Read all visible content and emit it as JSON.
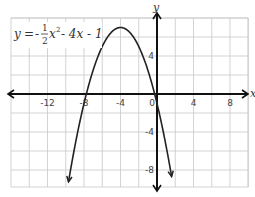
{
  "chart_data": {
    "type": "line",
    "title": "",
    "equation": {
      "lhs": "y",
      "eq": "=",
      "sign": "-",
      "frac_num": "1",
      "frac_den": "2",
      "rest_var": "x",
      "rest_exp": "2",
      "rest_tail": "- 4x - 1",
      "full": "y = -1/2 x^2 - 4x - 1"
    },
    "xlabel": "x",
    "ylabel": "y",
    "xlim": [
      -16,
      10
    ],
    "ylim": [
      -10,
      8
    ],
    "grid": true,
    "grid_step": 2,
    "x_ticks": [
      {
        "value": -12,
        "label": "-12"
      },
      {
        "value": -8,
        "label": "-8"
      },
      {
        "value": -4,
        "label": "-4"
      },
      {
        "value": 0,
        "label": "0"
      },
      {
        "value": 4,
        "label": "4"
      },
      {
        "value": 8,
        "label": "8"
      }
    ],
    "y_ticks": [
      {
        "value": 4,
        "label": "4"
      },
      {
        "value": -4,
        "label": "-4"
      },
      {
        "value": -8,
        "label": "-8"
      }
    ],
    "series": [
      {
        "name": "y = -1/2 x^2 - 4x - 1",
        "function": "-0.5*x*x - 4*x - 1",
        "x_range": [
          -9.7,
          1.6
        ],
        "vertex": [
          -4,
          7
        ],
        "x_intercepts": [
          -7.74,
          -0.26
        ],
        "y_intercept": -1,
        "color": "#222222"
      }
    ]
  }
}
